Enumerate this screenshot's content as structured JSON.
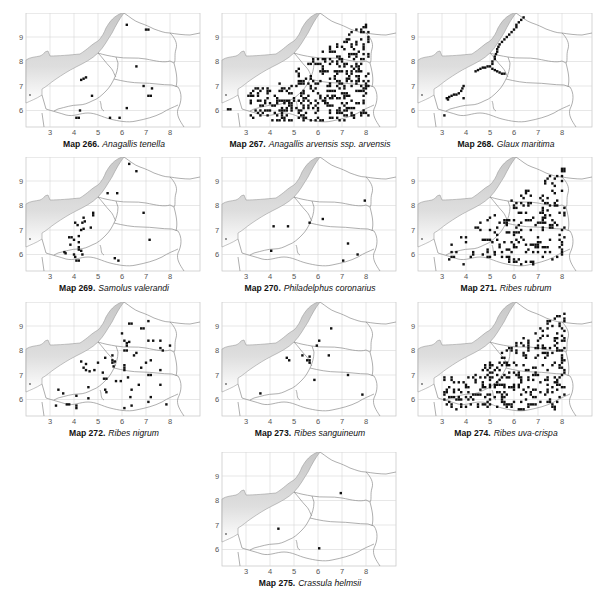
{
  "page": {
    "type": "species distribution map plate",
    "axis": {
      "x_ticks": [
        "3",
        "4",
        "5",
        "6",
        "7",
        "8"
      ],
      "y_ticks": [
        "9",
        "8",
        "7",
        "6"
      ]
    }
  },
  "maps": [
    {
      "id": "266",
      "label": "Map 266.",
      "species": "Anagallis tenella",
      "pos": [
        18,
        13
      ],
      "dots": [
        [
          6.2,
          9.5
        ],
        [
          7.0,
          9.3
        ],
        [
          7.1,
          9.3
        ],
        [
          6.6,
          7.8
        ],
        [
          4.3,
          7.25
        ],
        [
          4.4,
          7.3
        ],
        [
          4.5,
          7.35
        ],
        [
          6.9,
          7.0
        ],
        [
          7.25,
          6.9
        ],
        [
          7.1,
          6.6
        ],
        [
          7.2,
          6.6
        ],
        [
          4.75,
          6.6
        ],
        [
          4.25,
          6.0
        ],
        [
          6.2,
          6.1
        ],
        [
          4.1,
          5.7
        ],
        [
          4.2,
          5.7
        ],
        [
          5.5,
          5.7
        ],
        [
          5.9,
          5.7
        ]
      ]
    },
    {
      "id": "267",
      "label": "Map 267.",
      "species": "Anagallis arvensis ssp. arvensis",
      "pos": [
        214,
        13
      ],
      "dense": "arvensis"
    },
    {
      "id": "268",
      "label": "Map 268.",
      "species": "Glaux maritima",
      "pos": [
        410,
        13
      ],
      "dense": "glaux"
    },
    {
      "id": "269",
      "label": "Map 269.",
      "species": "Samolus valerandi",
      "pos": [
        18,
        157
      ],
      "dots": [
        [
          6.3,
          9.7
        ],
        [
          6.6,
          9.4
        ],
        [
          5.4,
          8.5
        ],
        [
          5.8,
          8.5
        ],
        [
          4.8,
          7.7
        ],
        [
          4.8,
          7.6
        ],
        [
          6.9,
          7.7
        ],
        [
          4.4,
          7.5
        ],
        [
          4.05,
          7.3
        ],
        [
          4.15,
          7.2
        ],
        [
          4.35,
          7.3
        ],
        [
          4.45,
          7.35
        ],
        [
          4.3,
          7.0
        ],
        [
          4.4,
          7.05
        ],
        [
          4.7,
          7.1
        ],
        [
          3.8,
          6.7
        ],
        [
          3.9,
          6.7
        ],
        [
          4.0,
          6.6
        ],
        [
          4.2,
          6.75
        ],
        [
          4.2,
          6.5
        ],
        [
          3.85,
          6.4
        ],
        [
          4.2,
          6.3
        ],
        [
          4.2,
          6.2
        ],
        [
          4.3,
          6.15
        ],
        [
          3.6,
          6.1
        ],
        [
          3.65,
          6.05
        ],
        [
          4.0,
          6.0
        ],
        [
          4.35,
          6.0
        ],
        [
          4.05,
          5.9
        ],
        [
          4.1,
          5.75
        ],
        [
          4.2,
          5.75
        ],
        [
          5.7,
          5.85
        ],
        [
          5.85,
          5.75
        ],
        [
          7.15,
          6.6
        ]
      ]
    },
    {
      "id": "270",
      "label": "Map 270.",
      "species": "Philadelphus coronarius",
      "pos": [
        214,
        157
      ],
      "dots": [
        [
          7.95,
          8.2
        ],
        [
          4.15,
          7.15
        ],
        [
          4.75,
          7.15
        ],
        [
          5.65,
          7.3
        ],
        [
          6.2,
          7.45
        ],
        [
          7.25,
          6.45
        ],
        [
          4.05,
          6.15
        ],
        [
          7.65,
          6.0
        ],
        [
          7.05,
          5.75
        ]
      ]
    },
    {
      "id": "271",
      "label": "Map 271.",
      "species": "Ribes rubrum",
      "pos": [
        410,
        157
      ],
      "dense": "rubrum"
    },
    {
      "id": "272",
      "label": "Map 272.",
      "species": "Ribes nigrum",
      "pos": [
        18,
        302
      ],
      "dots": [
        [
          6.3,
          9.1
        ],
        [
          6.4,
          9.1
        ],
        [
          7.1,
          9.2
        ],
        [
          6.8,
          8.9
        ],
        [
          6.9,
          8.9
        ],
        [
          6.0,
          8.7
        ],
        [
          6.1,
          8.4
        ],
        [
          6.2,
          8.3
        ],
        [
          6.3,
          8.35
        ],
        [
          6.2,
          8.2
        ],
        [
          6.1,
          8.0
        ],
        [
          6.2,
          8.0
        ],
        [
          7.1,
          8.4
        ],
        [
          7.3,
          8.4
        ],
        [
          7.6,
          8.4
        ],
        [
          8.0,
          8.2
        ],
        [
          7.6,
          8.1
        ],
        [
          7.7,
          8.0
        ],
        [
          6.6,
          7.9
        ],
        [
          6.5,
          7.8
        ],
        [
          5.6,
          7.8
        ],
        [
          5.3,
          7.7
        ],
        [
          5.6,
          7.6
        ],
        [
          5.7,
          7.55
        ],
        [
          5.6,
          7.5
        ],
        [
          5.0,
          7.5
        ],
        [
          4.3,
          7.55
        ],
        [
          4.5,
          7.45
        ],
        [
          4.4,
          7.3
        ],
        [
          4.5,
          7.2
        ],
        [
          4.65,
          7.15
        ],
        [
          4.85,
          7.2
        ],
        [
          5.65,
          7.35
        ],
        [
          6.1,
          7.4
        ],
        [
          6.1,
          7.3
        ],
        [
          6.1,
          7.2
        ],
        [
          7.2,
          7.6
        ],
        [
          7.0,
          7.5
        ],
        [
          6.8,
          7.3
        ],
        [
          5.2,
          7.1
        ],
        [
          7.6,
          7.2
        ],
        [
          5.25,
          6.85
        ],
        [
          5.35,
          6.85
        ],
        [
          5.75,
          6.75
        ],
        [
          5.95,
          6.75
        ],
        [
          6.25,
          6.9
        ],
        [
          7.1,
          7.0
        ],
        [
          7.2,
          7.0
        ],
        [
          6.7,
          6.6
        ],
        [
          7.6,
          6.6
        ],
        [
          4.6,
          6.5
        ],
        [
          5.3,
          6.4
        ],
        [
          5.35,
          6.3
        ],
        [
          6.4,
          6.4
        ],
        [
          3.35,
          6.4
        ],
        [
          3.55,
          6.25
        ],
        [
          4.1,
          6.15
        ],
        [
          6.35,
          6.1
        ],
        [
          7.2,
          6.1
        ],
        [
          4.6,
          6.05
        ],
        [
          7.1,
          5.9
        ],
        [
          3.25,
          5.75
        ],
        [
          3.7,
          5.8
        ],
        [
          3.8,
          5.8
        ],
        [
          4.1,
          5.75
        ],
        [
          4.1,
          5.65
        ],
        [
          6.1,
          5.65
        ],
        [
          6.4,
          5.75
        ],
        [
          7.85,
          5.8
        ]
      ]
    },
    {
      "id": "273",
      "label": "Map 273.",
      "species": "Ribes sanguineum",
      "pos": [
        214,
        302
      ],
      "dots": [
        [
          6.55,
          8.9
        ],
        [
          6.05,
          8.4
        ],
        [
          5.95,
          8.2
        ],
        [
          4.7,
          7.7
        ],
        [
          4.8,
          7.6
        ],
        [
          5.35,
          7.8
        ],
        [
          5.55,
          7.6
        ],
        [
          5.65,
          7.75
        ],
        [
          5.65,
          7.6
        ],
        [
          5.65,
          7.5
        ],
        [
          6.45,
          7.8
        ],
        [
          5.85,
          6.8
        ],
        [
          7.25,
          7.0
        ],
        [
          3.6,
          6.25
        ],
        [
          7.85,
          6.2
        ]
      ]
    },
    {
      "id": "274",
      "label": "Map 274.",
      "species": "Ribes uva-crispa",
      "pos": [
        410,
        302
      ],
      "dense": "uva"
    },
    {
      "id": "275",
      "label": "Map 275.",
      "species": "Crassula helmsii",
      "pos": [
        214,
        452
      ],
      "dots": [
        [
          6.95,
          8.3
        ],
        [
          4.35,
          6.85
        ],
        [
          6.05,
          6.05
        ]
      ]
    }
  ],
  "colors": {
    "dot": "#111111",
    "sea": "#cfcfcf",
    "grid": "#d8d8d8",
    "border": "#8a8a8a",
    "frame": "#bdbdbd"
  }
}
